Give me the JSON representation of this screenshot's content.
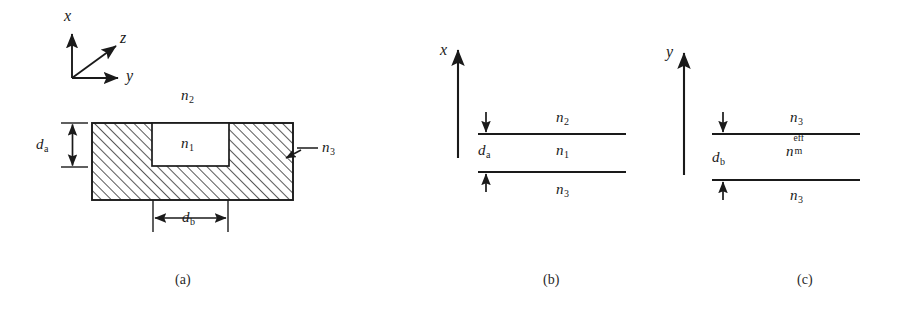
{
  "figure": {
    "type": "optical-waveguide-diagram",
    "panels": [
      {
        "id": "a",
        "caption": "(a)",
        "axes": [
          {
            "name": "x",
            "label": "x",
            "direction": "up"
          },
          {
            "name": "y",
            "label": "y",
            "direction": "right"
          },
          {
            "name": "z",
            "label": "z",
            "direction": "up-right-diagonal"
          }
        ],
        "region_labels": [
          {
            "name": "cover",
            "label": "n",
            "sub": "2",
            "sup": ""
          },
          {
            "name": "rib-core",
            "label": "n",
            "sub": "1",
            "sup": ""
          },
          {
            "name": "substrate",
            "label": "n",
            "sub": "3",
            "sup": ""
          }
        ],
        "dimensions": [
          {
            "name": "rib-height",
            "label": "d",
            "sub": "a",
            "orientation": "vertical"
          },
          {
            "name": "rib-width",
            "label": "d",
            "sub": "b",
            "orientation": "horizontal"
          }
        ]
      },
      {
        "id": "b",
        "caption": "(b)",
        "axes": [
          {
            "name": "x",
            "label": "x",
            "direction": "up"
          }
        ],
        "layers": [
          {
            "name": "top-layer",
            "label": "n",
            "sub": "2",
            "sup": ""
          },
          {
            "name": "guiding-layer",
            "label": "n",
            "sub": "1",
            "sup": ""
          },
          {
            "name": "bottom-layer",
            "label": "n",
            "sub": "3",
            "sup": ""
          }
        ],
        "dimensions": [
          {
            "name": "layer-thickness",
            "label": "d",
            "sub": "a",
            "orientation": "vertical"
          }
        ]
      },
      {
        "id": "c",
        "caption": "(c)",
        "axes": [
          {
            "name": "y",
            "label": "y",
            "direction": "up"
          }
        ],
        "layers": [
          {
            "name": "top-layer",
            "label": "n",
            "sub": "3",
            "sup": ""
          },
          {
            "name": "guiding-layer",
            "label": "n",
            "sub": "m",
            "sup": "eff"
          },
          {
            "name": "bottom-layer",
            "label": "n",
            "sub": "3",
            "sup": ""
          }
        ],
        "dimensions": [
          {
            "name": "layer-width",
            "label": "d",
            "sub": "b",
            "orientation": "vertical"
          }
        ]
      }
    ],
    "colors": {
      "stroke": "#1a1a1a",
      "background": "#ffffff",
      "hatch": "#1a1a1a"
    }
  },
  "text": {
    "axis_x": "x",
    "axis_y": "y",
    "axis_z": "z",
    "n2": "n",
    "n2_sub": "2",
    "n1": "n",
    "n1_sub": "1",
    "n3": "n",
    "n3_sub": "3",
    "nm": "n",
    "nm_sub": "m",
    "nm_sup": "eff",
    "d": "d",
    "da_sub": "a",
    "db_sub": "b",
    "caption_a": "(a)",
    "caption_b": "(b)",
    "caption_c": "(c)"
  }
}
